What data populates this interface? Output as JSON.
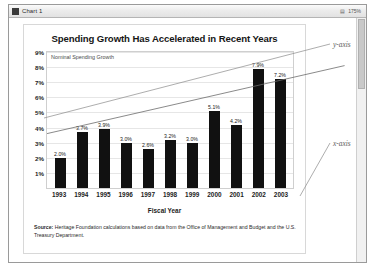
{
  "window": {
    "title": "Chart 1",
    "icon": "chart-window-icon",
    "toolbar_glyph": "▤",
    "zoom_level": "175%"
  },
  "chart_data": {
    "type": "bar",
    "title": "Spending Growth Has Accelerated in Recent Years",
    "subtitle": "Nominal Spending Growth",
    "xlabel": "Fiscal Year",
    "ylabel": "",
    "ylim": [
      0,
      9
    ],
    "grid": true,
    "legend": "none",
    "categories": [
      "1993",
      "1994",
      "1995",
      "1996",
      "1997",
      "1998",
      "1999",
      "2000",
      "2001",
      "2002",
      "2003"
    ],
    "values": [
      2.0,
      3.7,
      3.9,
      3.0,
      2.6,
      3.2,
      3.0,
      5.1,
      4.2,
      7.9,
      7.2
    ],
    "value_labels": [
      "2.0%",
      "3.7%",
      "3.9%",
      "3.0%",
      "2.6%",
      "3.2%",
      "3.0%",
      "5.1%",
      "4.2%",
      "7.9%",
      "7.2%"
    ],
    "ytick_labels": [
      "9%",
      "8%",
      "7%",
      "6%",
      "5%",
      "4%",
      "3%",
      "2%",
      "1%"
    ],
    "ytick_values": [
      9,
      8,
      7,
      6,
      5,
      4,
      3,
      2,
      1
    ],
    "bar_color": "#111111",
    "trendline": {
      "present": true,
      "color": "#6b6b6b",
      "start_value": 3.6,
      "end_value": 8.1
    }
  },
  "source": {
    "label": "Source:",
    "text": " Heritage Foundation calculations based on data from the Office of Management and Budget and the U.S. Treasury Department."
  },
  "annotations": {
    "y_axis": "y-axis",
    "x_axis": "x-axis"
  }
}
